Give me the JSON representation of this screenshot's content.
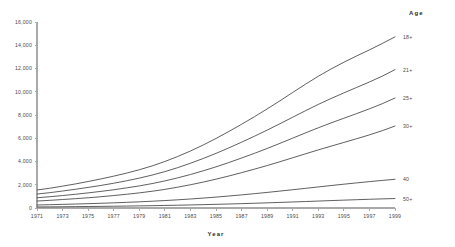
{
  "chart_data": {
    "type": "line",
    "title": "",
    "xlabel": "Year",
    "ylabel": "",
    "legend_title": "Age",
    "legend_position": "right-inline",
    "grid": false,
    "xlim": [
      1971,
      1999
    ],
    "ylim": [
      0,
      16000
    ],
    "x": [
      1971,
      1972,
      1973,
      1974,
      1975,
      1976,
      1977,
      1978,
      1979,
      1980,
      1981,
      1982,
      1983,
      1984,
      1985,
      1986,
      1987,
      1988,
      1989,
      1990,
      1991,
      1992,
      1993,
      1994,
      1995,
      1996,
      1997,
      1998,
      1999
    ],
    "xticks": [
      1971,
      1973,
      1975,
      1977,
      1979,
      1981,
      1983,
      1985,
      1987,
      1989,
      1991,
      1993,
      1995,
      1997,
      1999
    ],
    "xticklabels": [
      "1971",
      "1973",
      "1975",
      "1977",
      "1979",
      "1981",
      "1983",
      "1985",
      "1987",
      "1989",
      "1991",
      "1993",
      "1995",
      "1997",
      "1999"
    ],
    "yticks": [
      0,
      2000,
      4000,
      6000,
      8000,
      10000,
      12000,
      14000,
      16000
    ],
    "yticklabels": [
      "0",
      "2,000",
      "4,000",
      "6,000",
      "8,000",
      "10,000",
      "12,000",
      "14,000",
      "16,000"
    ],
    "line_color": "#4d4d4d",
    "series": [
      {
        "name": "18+",
        "label": "18+",
        "values": [
          1550,
          1700,
          1880,
          2070,
          2280,
          2500,
          2740,
          3000,
          3290,
          3620,
          4000,
          4430,
          4900,
          5420,
          5980,
          6580,
          7200,
          7850,
          8520,
          9220,
          9940,
          10650,
          11330,
          11960,
          12540,
          13080,
          13600,
          14150,
          14720
        ]
      },
      {
        "name": "21+",
        "label": "21+",
        "values": [
          1200,
          1320,
          1460,
          1610,
          1770,
          1940,
          2130,
          2340,
          2570,
          2830,
          3130,
          3470,
          3850,
          4260,
          4700,
          5170,
          5660,
          6170,
          6700,
          7250,
          7810,
          8370,
          8910,
          9420,
          9900,
          10370,
          10840,
          11340,
          11900
        ]
      },
      {
        "name": "25+",
        "label": "25+",
        "values": [
          880,
          970,
          1070,
          1180,
          1300,
          1430,
          1570,
          1730,
          1900,
          2100,
          2330,
          2590,
          2880,
          3200,
          3540,
          3910,
          4300,
          4700,
          5120,
          5560,
          6010,
          6460,
          6900,
          7320,
          7720,
          8120,
          8530,
          8970,
          9460
        ]
      },
      {
        "name": "30+",
        "label": "30+",
        "values": [
          600,
          660,
          730,
          800,
          880,
          970,
          1070,
          1180,
          1300,
          1440,
          1600,
          1790,
          2000,
          2230,
          2480,
          2750,
          3040,
          3340,
          3650,
          3980,
          4320,
          4660,
          5000,
          5320,
          5640,
          5960,
          6290,
          6650,
          7050
        ]
      },
      {
        "name": "40",
        "label": "40",
        "values": [
          260,
          285,
          312,
          341,
          372,
          406,
          444,
          486,
          532,
          583,
          640,
          704,
          775,
          853,
          938,
          1030,
          1128,
          1232,
          1341,
          1455,
          1572,
          1692,
          1812,
          1932,
          2048,
          2160,
          2268,
          2372,
          2470
        ]
      },
      {
        "name": "50+",
        "label": "50+",
        "values": [
          90,
          98,
          107,
          117,
          128,
          140,
          153,
          167,
          183,
          200,
          219,
          240,
          263,
          288,
          315,
          344,
          375,
          408,
          443,
          480,
          518,
          557,
          597,
          637,
          676,
          714,
          750,
          784,
          815
        ]
      }
    ]
  }
}
